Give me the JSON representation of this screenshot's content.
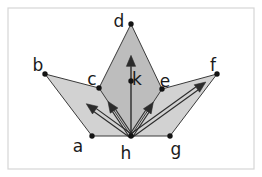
{
  "figure": {
    "canvas": {
      "width": 262,
      "height": 177
    },
    "colors": {
      "background": "#ffffff",
      "frame": "#d6d6d6",
      "outer_fill": "#d2d2d2",
      "inner_fill": "#bdbdbd",
      "edge": "#3a3a3a",
      "arrow": "#2b2b2b",
      "arrow_inner": "#f2f2f2",
      "dot": "#141414",
      "label": "#1a1a1a"
    },
    "frame": {
      "x": 8,
      "y": 8,
      "width": 246,
      "height": 161
    },
    "points": [
      {
        "id": "a",
        "label": "a",
        "x": 92,
        "y": 136,
        "label_x": 78,
        "label_y": 147
      },
      {
        "id": "b",
        "label": "b",
        "x": 45,
        "y": 74,
        "label_x": 38,
        "label_y": 66
      },
      {
        "id": "c",
        "label": "c",
        "x": 99,
        "y": 88,
        "label_x": 92,
        "label_y": 80
      },
      {
        "id": "d",
        "label": "d",
        "x": 131,
        "y": 24,
        "label_x": 119,
        "label_y": 22
      },
      {
        "id": "e",
        "label": "e",
        "x": 162,
        "y": 89,
        "label_x": 165,
        "label_y": 82
      },
      {
        "id": "f",
        "label": "f",
        "x": 217,
        "y": 74,
        "label_x": 213,
        "label_y": 66
      },
      {
        "id": "g",
        "label": "g",
        "x": 170,
        "y": 136,
        "label_x": 176,
        "label_y": 150
      },
      {
        "id": "h",
        "label": "h",
        "x": 131,
        "y": 136,
        "label_x": 126,
        "label_y": 154
      },
      {
        "id": "k",
        "label": "k",
        "x": 131,
        "y": 81,
        "label_x": 137,
        "label_y": 80
      }
    ],
    "polygons": [
      {
        "name": "left-wing",
        "fill": "outer_fill",
        "vertices": "a,b,c,h"
      },
      {
        "name": "center-diamond",
        "fill": "inner_fill",
        "vertices": "h,c,d,e"
      },
      {
        "name": "right-wing",
        "fill": "outer_fill",
        "vertices": "h,e,f,g"
      }
    ],
    "edges": [
      {
        "from": "a",
        "to": "b"
      },
      {
        "from": "b",
        "to": "c"
      },
      {
        "from": "c",
        "to": "d"
      },
      {
        "from": "d",
        "to": "e"
      },
      {
        "from": "e",
        "to": "f"
      },
      {
        "from": "f",
        "to": "g"
      },
      {
        "from": "g",
        "to": "h"
      },
      {
        "from": "h",
        "to": "a"
      },
      {
        "from": "c",
        "to": "h"
      },
      {
        "from": "e",
        "to": "h"
      }
    ],
    "vectors": [
      {
        "name": "h-to-b",
        "from": "h",
        "to": "b",
        "style": "outlined",
        "tip_fraction": 0.52
      },
      {
        "name": "h-to-c",
        "from": "h",
        "to": "c",
        "style": "outlined",
        "tip_fraction": 0.72
      },
      {
        "name": "h-to-d",
        "from": "h",
        "to": "d",
        "style": "thin",
        "tip_fraction": 0.72
      },
      {
        "name": "h-to-e",
        "from": "h",
        "to": "e",
        "style": "outlined",
        "tip_fraction": 0.72
      },
      {
        "name": "h-to-f",
        "from": "h",
        "to": "f",
        "style": "outlined",
        "tip_fraction": 0.87
      }
    ]
  }
}
